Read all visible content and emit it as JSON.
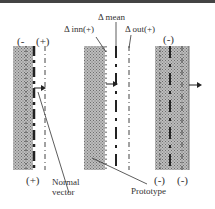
{
  "labels": {
    "delta_mean": "Δ mean",
    "delta_inn": "Δ inn(+)",
    "delta_out": "Δ out(+)",
    "normal_vector_line1": "Normal",
    "normal_vector_line2": "vector",
    "prototype": "Prototype"
  },
  "signs": {
    "panel1_top_left": "(-",
    "panel1_top_right": "(+)",
    "panel1_bottom": "(+)",
    "panel3_top": "(-)",
    "panel3_bottom_left": "(-)",
    "panel3_bottom_right": "(-)"
  },
  "colors": {
    "hatch": "#8a8a8a",
    "line": "#333333",
    "border": "#444444"
  }
}
